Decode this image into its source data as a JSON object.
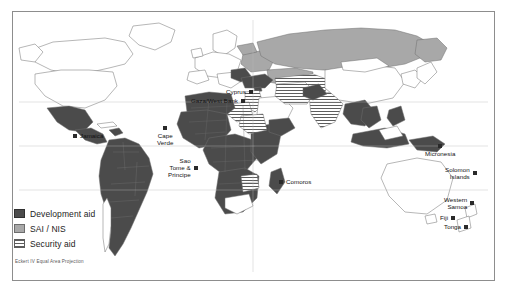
{
  "figure": {
    "projection_note": "Eckert IV Equal Area Projection"
  },
  "legend": {
    "items": [
      {
        "label": "Development aid",
        "swatch": "solid-dark-gray",
        "color": "#4b4b4b"
      },
      {
        "label": "SAI / NIS",
        "swatch": "solid-light-gray",
        "color": "#a8a8a8"
      },
      {
        "label": "Security aid",
        "swatch": "horizontal-hatch",
        "color": "#5d5d5d"
      }
    ]
  },
  "map": {
    "ocean_color": "#ffffff",
    "land_default_color": "#ffffff",
    "border_color": "#8d8d8d",
    "callouts": [
      {
        "name": "jamaica",
        "label": "Jamaica",
        "x": 72,
        "y": 126,
        "marker": "left",
        "align": "left"
      },
      {
        "name": "cape-verde",
        "label": "Cape\nVerde",
        "x": 164,
        "y": 125,
        "marker": "above",
        "align": "center"
      },
      {
        "name": "sao-tome-principe",
        "label": "Sao\nTome &\nPrincipe",
        "x": 186,
        "y": 158,
        "marker": "right",
        "align": "right"
      },
      {
        "name": "cyprus",
        "label": "Cyprus",
        "x": 242,
        "y": 88,
        "marker": "right",
        "align": "right"
      },
      {
        "name": "gaza-west-bank",
        "label": "Gaza/West Bank",
        "x": 206,
        "y": 97,
        "marker": "right",
        "align": "right"
      },
      {
        "name": "comoros",
        "label": "Comoros",
        "x": 278,
        "y": 177,
        "marker": "left",
        "align": "left"
      },
      {
        "name": "micronesia",
        "label": "Micronesia",
        "x": 434,
        "y": 146,
        "marker": "below",
        "align": "center"
      },
      {
        "name": "solomon-islands",
        "label": "Solomon\nIslands",
        "x": 463,
        "y": 166,
        "marker": "right",
        "align": "right"
      },
      {
        "name": "western-samoa",
        "label": "Western\nSamoa",
        "x": 462,
        "y": 196,
        "marker": "right",
        "align": "right"
      },
      {
        "name": "fiji",
        "label": "Fiji",
        "x": 446,
        "y": 212,
        "marker": "right",
        "align": "right"
      },
      {
        "name": "tonga",
        "label": "Tonga",
        "x": 452,
        "y": 222,
        "marker": "right",
        "align": "right"
      }
    ]
  }
}
